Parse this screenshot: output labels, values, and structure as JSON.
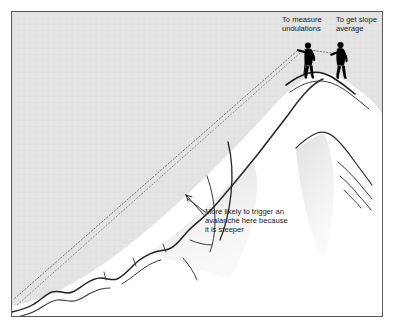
{
  "figure": {
    "background_color": "#e8e8e8",
    "sky_color": "#e3e3e3",
    "snow_color": "#ffffff",
    "ink_color": "#1a1a1a",
    "shade_color": "#dcdcdc",
    "border_color": "#4a4a4a",
    "border_width_px": 1,
    "canvas": {
      "width": 394,
      "height": 328
    }
  },
  "callouts": [
    {
      "id": "to-measure-undulations",
      "text": "To measure\nundulations",
      "x": 282,
      "y": 16
    },
    {
      "id": "to-get-slope-average",
      "text": "To get slope\naverage",
      "x": 336,
      "y": 16
    }
  ],
  "annotations": [
    {
      "id": "avalanche-warning",
      "text": "More likely to trigger an\navalanche here because\nit is steeper",
      "x": 205,
      "y": 208,
      "pointer": "arrow pointing up-left to steep slope section"
    }
  ],
  "figures_on_ridge": [
    {
      "id": "surveyor-left",
      "role": "measuring undulations",
      "silhouette_color": "#000000",
      "instrument": "inclinometer",
      "sight_line": "dotted, aimed down the long slope"
    },
    {
      "id": "surveyor-right",
      "role": "getting slope average",
      "silhouette_color": "#000000",
      "instrument": "inclinometer",
      "sight_line": "dotted, short, toward left figure"
    }
  ],
  "terrain": {
    "left_slope": "long undulating slope descending to lower-left",
    "summit": "rounded ridge crest where the two figures stand",
    "right_flank": "far side of the peak with branching ridge lines",
    "dotted_sight_lines": 2,
    "steep_section_marker": "arrow annotation at mid-slope"
  }
}
